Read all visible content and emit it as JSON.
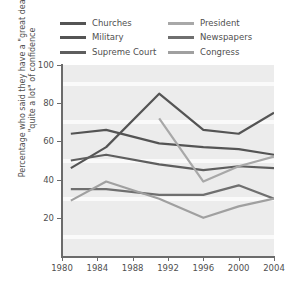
{
  "chart_data": {
    "type": "line",
    "title": "",
    "xlabel": "",
    "ylabel": "Percentage who said they have a \"great deal\" or \"quite a lot\" of confidence",
    "xlim": [
      1980,
      2004
    ],
    "ylim": [
      0,
      100
    ],
    "xticks": [
      1980,
      1984,
      1988,
      1992,
      1996,
      2000,
      2004
    ],
    "yticks": [
      20,
      40,
      60,
      80,
      100
    ],
    "xtick_labels": [
      "1980",
      "1984",
      "1988",
      "1992",
      "1996",
      "2000",
      "2004"
    ],
    "ytick_labels": [
      "20",
      "40",
      "60",
      "80",
      "100"
    ],
    "grid": "horizontal-white-bands",
    "legend_position": "above-plot-two-columns",
    "series": [
      {
        "name": "Churches",
        "color": "#545454",
        "x": [
          1981,
          1985,
          1991,
          1996,
          2000,
          2004
        ],
        "values": [
          64,
          66,
          59,
          57,
          56,
          53
        ]
      },
      {
        "name": "Military",
        "color": "#545454",
        "x": [
          1981,
          1985,
          1991,
          1996,
          2000,
          2004
        ],
        "values": [
          46,
          57,
          85,
          66,
          64,
          75
        ]
      },
      {
        "name": "Supreme Court",
        "color": "#5e5e5e",
        "x": [
          1981,
          1985,
          1991,
          1996,
          2000,
          2004
        ],
        "values": [
          50,
          53,
          48,
          45,
          47,
          46
        ]
      },
      {
        "name": "President",
        "color": "#a8a8a8",
        "x": [
          1991,
          1996,
          2000,
          2004
        ],
        "values": [
          72,
          39,
          47,
          52
        ]
      },
      {
        "name": "Newspapers",
        "color": "#6f6f6f",
        "x": [
          1981,
          1985,
          1991,
          1996,
          2000,
          2004
        ],
        "values": [
          35,
          35,
          32,
          32,
          37,
          30
        ]
      },
      {
        "name": "Congress",
        "color": "#a0a0a0",
        "x": [
          1981,
          1985,
          1991,
          1996,
          2000,
          2004
        ],
        "values": [
          29,
          39,
          30,
          20,
          26,
          30
        ]
      }
    ]
  },
  "legend": {
    "column_left": [
      {
        "label": "Churches",
        "color": "#545454"
      },
      {
        "label": "Military",
        "color": "#545454"
      },
      {
        "label": "Supreme Court",
        "color": "#5e5e5e"
      }
    ],
    "column_right": [
      {
        "label": "President",
        "color": "#a8a8a8"
      },
      {
        "label": "Newspapers",
        "color": "#6f6f6f"
      },
      {
        "label": "Congress",
        "color": "#a0a0a0"
      }
    ]
  },
  "axes": {
    "y_axis_label": "Percentage who said they have a \"great deal\" or \"quite a lot\" of confidence",
    "y_tick_labels": [
      "100",
      "80",
      "60",
      "40",
      "20"
    ],
    "x_tick_labels": [
      "1980",
      "1984",
      "1988",
      "1992",
      "1996",
      "2000",
      "2004"
    ]
  },
  "colors": {
    "plot_background": "#ececec",
    "gridline": "#fafafa",
    "axis": "#6b6b6b",
    "text": "#4f4f4f",
    "page_background": "#ffffff"
  }
}
